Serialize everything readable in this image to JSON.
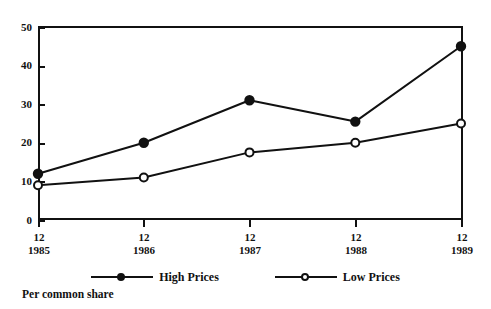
{
  "chart_data": {
    "type": "line",
    "title": "",
    "subtitle": "",
    "xlabel": "",
    "ylabel": "",
    "caption": "Per common share",
    "categories": [
      "12\n1985",
      "12\n1986",
      "12\n1987",
      "12\n1988",
      "12\n1989"
    ],
    "x_tick_months": [
      "12",
      "12",
      "12",
      "12",
      "12"
    ],
    "x_tick_years": [
      "1985",
      "1986",
      "1987",
      "1988",
      "1989"
    ],
    "ylim": [
      0,
      50
    ],
    "y_ticks": [
      0,
      10,
      20,
      30,
      40,
      50
    ],
    "y_tick_labels": [
      "0",
      "10",
      "20",
      "30",
      "40",
      "50"
    ],
    "grid": false,
    "legend_position": "bottom",
    "series": [
      {
        "name": "High Prices",
        "marker": "filled-circle",
        "color": "#111111",
        "values": [
          12,
          20,
          31,
          25.5,
          45
        ]
      },
      {
        "name": "Low Prices",
        "marker": "open-circle",
        "color": "#111111",
        "values": [
          9,
          11,
          17.5,
          20,
          25
        ]
      }
    ]
  },
  "legend": {
    "entries": [
      {
        "label": "High Prices",
        "marker": "filled-circle"
      },
      {
        "label": "Low Prices",
        "marker": "open-circle"
      }
    ]
  },
  "caption": {
    "text": "Per common share"
  },
  "colors": {
    "ink": "#111111",
    "paper": "#ffffff"
  }
}
